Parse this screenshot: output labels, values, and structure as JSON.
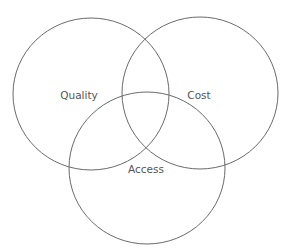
{
  "diagram": {
    "type": "venn",
    "sets": [
      {
        "id": "quality",
        "label": "Quality",
        "cx": 91,
        "cy": 94,
        "rx": 78,
        "ry": 76,
        "label_x": 79,
        "label_y": 99
      },
      {
        "id": "cost",
        "label": "Cost",
        "cx": 200,
        "cy": 93,
        "rx": 78,
        "ry": 76,
        "label_x": 199,
        "label_y": 99
      },
      {
        "id": "access",
        "label": "Access",
        "cx": 147,
        "cy": 168,
        "rx": 78,
        "ry": 76,
        "label_x": 146,
        "label_y": 173
      }
    ],
    "colors": {
      "stroke": "#6a6a6a",
      "text": "#555555",
      "background": "#ffffff"
    }
  }
}
